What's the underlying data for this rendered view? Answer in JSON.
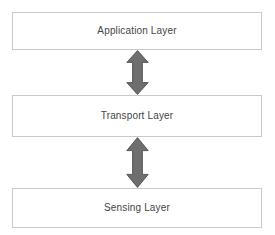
{
  "diagram": {
    "background_color": "#ffffff",
    "box_border_color": "#c9c9c9",
    "box_fill_color": "#ffffff",
    "label_color": "#454545",
    "arrow_fill_color": "#6e6e6e",
    "arrow_stroke_color": "#4f4f4f",
    "layers": [
      {
        "id": "application",
        "label": "Application Layer"
      },
      {
        "id": "transport",
        "label": "Transport Layer"
      },
      {
        "id": "sensing",
        "label": "Sensing Layer"
      }
    ],
    "connectors": [
      {
        "id": "application-transport",
        "icon": "double-headed-vertical-arrow-icon",
        "from": "Application Layer",
        "to": "Transport Layer",
        "direction": "bidirectional"
      },
      {
        "id": "transport-sensing",
        "icon": "double-headed-vertical-arrow-icon",
        "from": "Transport Layer",
        "to": "Sensing Layer",
        "direction": "bidirectional"
      }
    ]
  }
}
